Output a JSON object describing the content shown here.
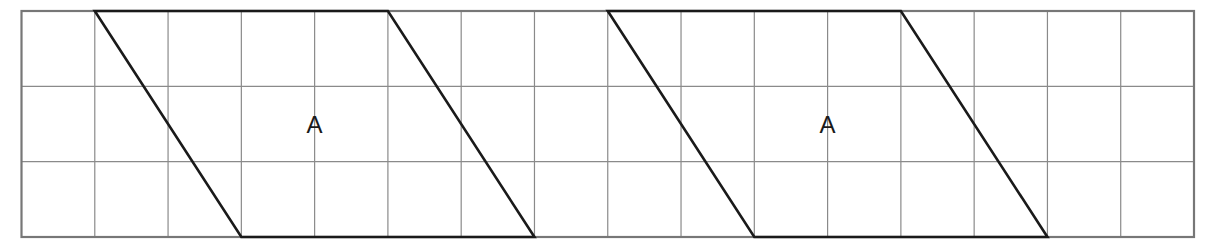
{
  "diagram": {
    "type": "grid-with-parallelograms",
    "grid": {
      "columns": 16,
      "rows": 3,
      "line_color": "#8a8a8a",
      "border_color": "#777777"
    },
    "shapes": [
      {
        "name": "parallelogram-a-left",
        "label": "A",
        "vertices_grid": [
          [
            1,
            0
          ],
          [
            5,
            0
          ],
          [
            7,
            3
          ],
          [
            3,
            3
          ]
        ]
      },
      {
        "name": "parallelogram-a-right",
        "label": "A",
        "vertices_grid": [
          [
            8,
            0
          ],
          [
            12,
            0
          ],
          [
            14,
            3
          ],
          [
            10,
            3
          ]
        ]
      }
    ],
    "shape_color": "#1a1a1a"
  }
}
